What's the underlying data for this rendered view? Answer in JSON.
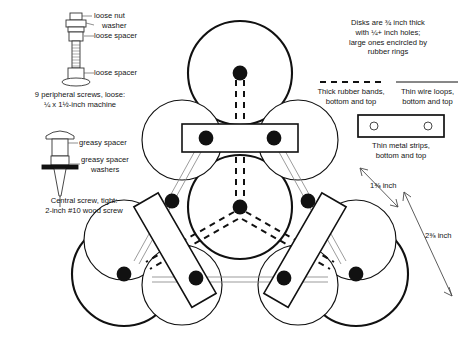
{
  "diagram": {
    "peripheral_screw": {
      "callouts": [
        {
          "name": "loose-nut",
          "text": "loose nut"
        },
        {
          "name": "washer",
          "text": "washer"
        },
        {
          "name": "loose-spacer-upper",
          "text": "loose spacer"
        },
        {
          "name": "loose-spacer-lower",
          "text": "loose spacer"
        }
      ],
      "caption_line1": "9 peripheral screws, loose:",
      "caption_line2": "¼ x 1½-inch machine"
    },
    "central_screw": {
      "callouts": [
        {
          "name": "greasy-spacer",
          "text": "greasy spacer"
        },
        {
          "name": "greasy-spacer-washers-line1",
          "text": "greasy spacer"
        },
        {
          "name": "greasy-spacer-washers-line2",
          "text": "washers"
        }
      ],
      "caption_line1": "Central screw, tight:",
      "caption_line2": "2-inch #10 wood screw"
    },
    "disk_note": {
      "line1": "Disks are ¾ inch thick",
      "line2": "with ¼+ inch holes;",
      "line3": "large ones encircled by",
      "line4": "rubber rings"
    },
    "legend": [
      {
        "name": "legend-rubber-bands",
        "swatch": "thick-dashed-line",
        "line1": "Thick rubber bands,",
        "line2": "bottom and top"
      },
      {
        "name": "legend-wire-loops",
        "swatch": "thin-solid-line",
        "line1": "Thin wire loops,",
        "line2": "bottom and top"
      },
      {
        "name": "legend-metal-strips",
        "swatch": "strip-with-two-holes",
        "line1": "Thin metal strips,",
        "line2": "bottom and top"
      }
    ],
    "dimensions": [
      {
        "name": "dimension-small",
        "text": "1⅜ inch"
      },
      {
        "name": "dimension-large",
        "text": "2⅜ inch"
      }
    ]
  },
  "colors": {
    "ink": "#111111",
    "rule": "#6f6f6f",
    "paper": "#ffffff"
  }
}
